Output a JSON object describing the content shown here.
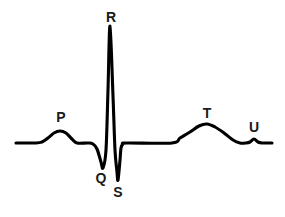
{
  "figure": {
    "name": "ecg-waveform-diagram",
    "background_color": "#ffffff",
    "stroke_color": "#000000",
    "label_color": "#1a1a1a",
    "width": 285,
    "height": 217
  },
  "labels": {
    "p": "P",
    "q": "Q",
    "r": "R",
    "s": "S",
    "t": "T",
    "u": "U"
  },
  "chart_data": {
    "type": "line",
    "title": "",
    "subtitle": "",
    "xlabel": "",
    "ylabel": "",
    "grid": false,
    "legend": "none",
    "axis_visible": false,
    "baseline_y": 143,
    "xlim": [
      0,
      285
    ],
    "ylim": [
      217,
      0
    ],
    "annotations": [
      {
        "name": "P",
        "label": "P",
        "label_x": 61,
        "label_y": 122,
        "peak_x": 61,
        "peak_y": 131
      },
      {
        "name": "Q",
        "label": "Q",
        "label_x": 101,
        "label_y": 183,
        "peak_x": 103,
        "peak_y": 168
      },
      {
        "name": "R",
        "label": "R",
        "label_x": 111,
        "label_y": 22,
        "peak_x": 110,
        "peak_y": 26
      },
      {
        "name": "S",
        "label": "S",
        "label_x": 118,
        "label_y": 197,
        "peak_x": 118,
        "peak_y": 180
      },
      {
        "name": "T",
        "label": "T",
        "label_x": 207,
        "label_y": 118,
        "peak_x": 207,
        "peak_y": 124
      },
      {
        "name": "U",
        "label": "U",
        "label_x": 254,
        "label_y": 132,
        "peak_x": 254,
        "peak_y": 139
      }
    ],
    "series": [
      {
        "name": "ecg-trace",
        "points": [
          [
            16,
            143
          ],
          [
            36,
            143
          ],
          [
            42,
            142
          ],
          [
            48,
            138
          ],
          [
            54,
            133
          ],
          [
            60,
            131
          ],
          [
            66,
            133
          ],
          [
            72,
            139
          ],
          [
            77,
            143
          ],
          [
            88,
            143
          ],
          [
            93,
            144
          ],
          [
            97,
            149
          ],
          [
            101,
            162
          ],
          [
            103,
            168
          ],
          [
            106,
            150
          ],
          [
            108,
            90
          ],
          [
            110,
            26
          ],
          [
            113,
            96
          ],
          [
            115,
            150
          ],
          [
            117,
            172
          ],
          [
            118,
            180
          ],
          [
            120,
            160
          ],
          [
            121,
            148
          ],
          [
            123,
            144
          ],
          [
            127,
            143
          ],
          [
            172,
            143
          ],
          [
            180,
            138
          ],
          [
            190,
            132
          ],
          [
            199,
            126
          ],
          [
            207,
            124
          ],
          [
            215,
            127
          ],
          [
            224,
            133
          ],
          [
            233,
            140
          ],
          [
            240,
            143
          ],
          [
            246,
            143
          ],
          [
            250,
            142
          ],
          [
            254,
            139
          ],
          [
            258,
            142
          ],
          [
            262,
            143
          ],
          [
            272,
            143
          ]
        ]
      }
    ]
  }
}
